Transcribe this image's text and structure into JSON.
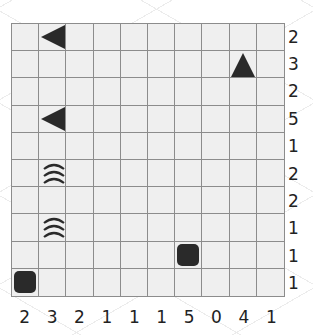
{
  "puzzle": {
    "type": "battleships",
    "rows": 10,
    "cols": 10,
    "row_clues": [
      "2",
      "3",
      "2",
      "5",
      "1",
      "2",
      "2",
      "1",
      "1",
      "1"
    ],
    "col_clues": [
      "2",
      "3",
      "2",
      "1",
      "1",
      "1",
      "5",
      "0",
      "4",
      "1"
    ],
    "cells": [
      {
        "row": 0,
        "col": 1,
        "icon": "ship-end-left-icon"
      },
      {
        "row": 1,
        "col": 8,
        "icon": "ship-end-up-icon"
      },
      {
        "row": 3,
        "col": 1,
        "icon": "ship-end-left-icon"
      },
      {
        "row": 5,
        "col": 1,
        "icon": "water-icon"
      },
      {
        "row": 7,
        "col": 1,
        "icon": "water-icon"
      },
      {
        "row": 8,
        "col": 6,
        "icon": "ship-single-icon"
      },
      {
        "row": 9,
        "col": 0,
        "icon": "ship-single-icon"
      }
    ]
  },
  "colors": {
    "grid_bg": "#efefef",
    "grid_line": "#8c8c8c",
    "ship": "#2a2a2a",
    "clue_text": "#222222"
  }
}
